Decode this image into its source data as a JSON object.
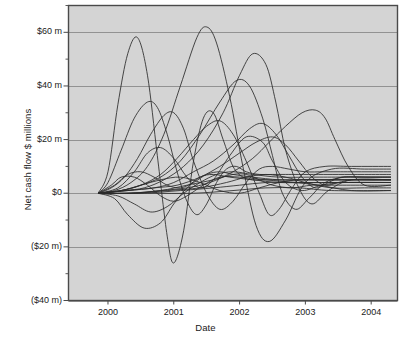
{
  "chart_data": {
    "type": "line",
    "title": "",
    "xlabel": "Date",
    "ylabel": "Net cash flow $ millions",
    "xlim": [
      1999.4,
      2004.4
    ],
    "ylim": [
      -40,
      70
    ],
    "grid": true,
    "legend_position": "none",
    "x_ticks": [
      {
        "value": 2000,
        "label": "2000"
      },
      {
        "value": 2001,
        "label": "2001"
      },
      {
        "value": 2002,
        "label": "2002"
      },
      {
        "value": 2003,
        "label": "2003"
      },
      {
        "value": 2004,
        "label": "2004"
      }
    ],
    "y_ticks": [
      {
        "value": 60,
        "label": "$60 m"
      },
      {
        "value": 40,
        "label": "$40 m"
      },
      {
        "value": 20,
        "label": "$20 m"
      },
      {
        "value": 0,
        "label": "$0"
      },
      {
        "value": -20,
        "label": "($20 m)"
      },
      {
        "value": -40,
        "label": "($40 m)"
      }
    ],
    "y_minor_ticks": [
      70,
      50,
      30,
      10,
      -10,
      -30
    ],
    "series": [
      {
        "name": "project-01",
        "x": [
          1999.85,
          2000.0,
          2000.15,
          2000.3,
          2000.45,
          2000.6,
          2000.75,
          2000.9,
          2001.0,
          2001.15,
          2001.3,
          2001.45,
          2001.6,
          2001.75,
          2001.9,
          2002.05,
          2002.2,
          2002.35,
          2002.5,
          2002.65,
          2002.8,
          2003.0,
          2003.2,
          2003.4,
          2003.6,
          2003.9,
          2004.3
        ],
        "y": [
          0,
          8,
          33,
          52,
          58,
          44,
          14,
          -16,
          -26,
          -14,
          12,
          28,
          30,
          20,
          10,
          6,
          5,
          5,
          5,
          5,
          5,
          5,
          5,
          5,
          5,
          5,
          5
        ]
      },
      {
        "name": "project-02",
        "x": [
          1999.85,
          2000.0,
          2000.2,
          2000.4,
          2000.6,
          2000.75,
          2000.9,
          2001.05,
          2001.2,
          2001.35,
          2001.5,
          2001.65,
          2001.8,
          2001.95,
          2002.1,
          2002.3,
          2002.5,
          2002.7,
          2002.9,
          2003.2,
          2003.5,
          2003.9,
          2004.3
        ],
        "y": [
          0,
          4,
          16,
          28,
          34,
          32,
          22,
          8,
          -3,
          -8,
          -4,
          4,
          9,
          10,
          8,
          7,
          7,
          7,
          7,
          7,
          7,
          7,
          7
        ]
      },
      {
        "name": "project-03",
        "x": [
          1999.85,
          2000.05,
          2000.25,
          2000.45,
          2000.65,
          2000.85,
          2001.0,
          2001.15,
          2001.3,
          2001.5,
          2001.7,
          2001.9,
          2002.1,
          2002.3,
          2002.5,
          2002.75,
          2003.0,
          2003.3,
          2003.7,
          2004.3
        ],
        "y": [
          0,
          2,
          6,
          13,
          22,
          29,
          30,
          24,
          12,
          0,
          -6,
          -3,
          4,
          9,
          10,
          9,
          8,
          8,
          8,
          8
        ]
      },
      {
        "name": "project-04",
        "x": [
          1999.85,
          2000.1,
          2000.35,
          2000.6,
          2000.85,
          2001.1,
          2001.35,
          2001.5,
          2001.65,
          2001.85,
          2002.05,
          2002.25,
          2002.45,
          2002.7,
          2003.0,
          2003.4,
          2003.9,
          2004.3
        ],
        "y": [
          0,
          1,
          4,
          10,
          22,
          40,
          58,
          62,
          56,
          36,
          10,
          -12,
          -18,
          -10,
          4,
          9,
          9,
          9
        ]
      },
      {
        "name": "project-05",
        "x": [
          1999.85,
          2000.2,
          2000.5,
          2000.8,
          2001.05,
          2001.3,
          2001.5,
          2001.7,
          2001.9,
          2002.1,
          2002.3,
          2002.45,
          2002.6,
          2002.8,
          2003.0,
          2003.3,
          2003.7,
          2004.3
        ],
        "y": [
          0,
          1,
          3,
          7,
          13,
          20,
          25,
          27,
          22,
          12,
          0,
          -8,
          -6,
          2,
          8,
          10,
          10,
          10
        ]
      },
      {
        "name": "project-06",
        "x": [
          1999.85,
          2000.15,
          2000.4,
          2000.6,
          2000.8,
          2001.0,
          2001.2,
          2001.4,
          2001.6,
          2001.85,
          2002.1,
          2002.35,
          2002.5,
          2002.7,
          2002.95,
          2003.25,
          2003.6,
          2004.3
        ],
        "y": [
          0,
          2,
          8,
          15,
          17,
          13,
          6,
          2,
          5,
          14,
          21,
          19,
          12,
          4,
          1,
          3,
          4,
          4
        ]
      },
      {
        "name": "project-07",
        "x": [
          1999.85,
          2000.2,
          2000.5,
          2000.8,
          2001.1,
          2001.4,
          2001.7,
          2001.95,
          2002.15,
          2002.35,
          2002.5,
          2002.65,
          2002.85,
          2003.05,
          2003.3,
          2003.6,
          2004.0,
          2004.3
        ],
        "y": [
          0,
          1,
          3,
          6,
          12,
          22,
          34,
          42,
          40,
          28,
          14,
          0,
          -6,
          -2,
          4,
          6,
          6,
          6
        ]
      },
      {
        "name": "project-08",
        "x": [
          1999.85,
          2000.25,
          2000.55,
          2000.85,
          2001.15,
          2001.45,
          2001.75,
          2002.0,
          2002.2,
          2002.4,
          2002.55,
          2002.7,
          2002.9,
          2003.1,
          2003.35,
          2003.7,
          2004.3
        ],
        "y": [
          0,
          1,
          2,
          5,
          10,
          18,
          30,
          44,
          52,
          48,
          34,
          16,
          2,
          -4,
          1,
          5,
          5
        ]
      },
      {
        "name": "project-09",
        "x": [
          1999.85,
          2000.3,
          2000.7,
          2001.0,
          2001.3,
          2001.6,
          2001.9,
          2002.15,
          2002.35,
          2002.55,
          2002.75,
          2002.95,
          2003.15,
          2003.35,
          2003.55,
          2003.8,
          2004.3
        ],
        "y": [
          0,
          1,
          2,
          4,
          8,
          12,
          18,
          24,
          26,
          22,
          14,
          6,
          2,
          4,
          6,
          6,
          6
        ]
      },
      {
        "name": "project-10",
        "x": [
          1999.85,
          2000.3,
          2000.7,
          2001.05,
          2001.4,
          2001.7,
          2002.0,
          2002.25,
          2002.5,
          2002.7,
          2002.9,
          2003.1,
          2003.3,
          2003.5,
          2003.7,
          2004.0,
          2004.3
        ],
        "y": [
          0,
          1,
          2,
          3,
          6,
          10,
          15,
          19,
          21,
          18,
          12,
          6,
          3,
          4,
          5,
          5,
          5
        ]
      },
      {
        "name": "project-11",
        "x": [
          1999.85,
          2000.35,
          2000.8,
          2001.2,
          2001.55,
          2001.9,
          2002.2,
          2002.45,
          2002.7,
          2002.95,
          2003.15,
          2003.3,
          2003.45,
          2003.65,
          2003.9,
          2004.3
        ],
        "y": [
          0,
          0,
          1,
          2,
          4,
          8,
          13,
          19,
          25,
          30,
          31,
          28,
          20,
          10,
          3,
          3
        ]
      },
      {
        "name": "project-12",
        "x": [
          1999.85,
          2000.1,
          2000.3,
          2000.5,
          2000.7,
          2000.9,
          2001.1,
          2001.3,
          2001.5,
          2001.7,
          2001.9,
          2002.2,
          2002.6,
          2003.0,
          2003.5,
          2004.3
        ],
        "y": [
          0,
          3,
          7,
          8,
          6,
          3,
          2,
          4,
          7,
          8,
          7,
          6,
          5,
          5,
          5,
          5
        ]
      },
      {
        "name": "project-13",
        "x": [
          1999.85,
          2000.05,
          2000.2,
          2000.4,
          2000.6,
          2000.8,
          2001.0,
          2001.2,
          2001.45,
          2001.7,
          2002.0,
          2002.4,
          2002.9,
          2003.4,
          2004.3
        ],
        "y": [
          0,
          3,
          6,
          6,
          3,
          -1,
          -3,
          -1,
          3,
          6,
          6,
          5,
          4,
          4,
          4
        ]
      },
      {
        "name": "project-14",
        "x": [
          1999.85,
          2000.1,
          2000.3,
          2000.55,
          2000.8,
          2001.0,
          2001.2,
          2001.4,
          2001.6,
          2001.85,
          2002.2,
          2002.6,
          2003.1,
          2003.7,
          2004.3
        ],
        "y": [
          0,
          -2,
          -8,
          -13,
          -11,
          -4,
          2,
          6,
          7,
          6,
          5,
          4,
          4,
          4,
          4
        ]
      },
      {
        "name": "project-15",
        "x": [
          1999.85,
          2000.15,
          2000.4,
          2000.65,
          2000.9,
          2001.15,
          2001.4,
          2001.65,
          2001.9,
          2002.2,
          2002.6,
          2003.1,
          2003.6,
          2004.3
        ],
        "y": [
          0,
          -1,
          -4,
          -7,
          -5,
          0,
          4,
          7,
          8,
          7,
          6,
          6,
          6,
          6
        ]
      },
      {
        "name": "project-16",
        "x": [
          1999.85,
          2000.2,
          2000.5,
          2000.8,
          2001.1,
          2001.4,
          2001.7,
          2002.0,
          2002.3,
          2002.6,
          2002.9,
          2003.3,
          2003.8,
          2004.3
        ],
        "y": [
          0,
          1,
          3,
          5,
          6,
          4,
          1,
          0,
          2,
          4,
          5,
          5,
          5,
          5
        ]
      },
      {
        "name": "project-17",
        "x": [
          1999.85,
          2000.3,
          2000.8,
          2001.2,
          2001.6,
          2001.9,
          2002.1,
          2002.3,
          2002.5,
          2002.8,
          2003.1,
          2003.5,
          2004.0,
          2004.3
        ],
        "y": [
          0,
          0,
          1,
          3,
          5,
          7,
          7,
          5,
          3,
          2,
          3,
          3,
          3,
          3
        ]
      },
      {
        "name": "project-18",
        "x": [
          1999.85,
          2000.4,
          2000.9,
          2001.4,
          2001.8,
          2002.1,
          2002.4,
          2002.7,
          2003.0,
          2003.4,
          2003.9,
          2004.3
        ],
        "y": [
          0,
          0,
          1,
          2,
          4,
          6,
          7,
          6,
          4,
          2,
          2,
          2
        ]
      },
      {
        "name": "project-19",
        "x": [
          1999.85,
          2000.5,
          2001.1,
          2001.6,
          2002.0,
          2002.4,
          2002.8,
          2003.2,
          2003.7,
          2004.3
        ],
        "y": [
          0,
          0,
          1,
          2,
          3,
          4,
          4,
          3,
          1,
          1
        ]
      },
      {
        "name": "project-20",
        "x": [
          1999.85,
          2000.6,
          2001.3,
          2001.9,
          2002.4,
          2002.9,
          2003.4,
          2004.3
        ],
        "y": [
          0,
          0,
          0,
          1,
          2,
          2,
          1,
          1
        ]
      }
    ],
    "colors": {
      "plot_background": "#d4d4d4",
      "page_background": "#ffffff",
      "grid": "#8a8a8a",
      "axis": "#4a4a4a",
      "line": "#2b2b2b",
      "text": "#1a1a1a"
    }
  }
}
